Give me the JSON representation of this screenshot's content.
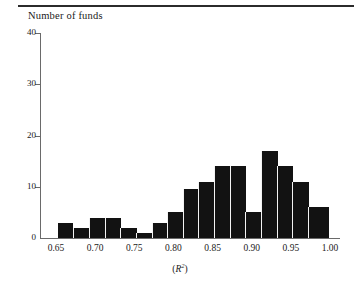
{
  "figure": {
    "top_rule": true,
    "title": "Number of funds",
    "x_axis_title_prefix": "(",
    "x_axis_title_var": "R",
    "x_axis_title_exp": "2",
    "x_axis_title_suffix": ")"
  },
  "chart_data": {
    "type": "bar",
    "title": "Number of funds",
    "xlabel": "(R^2)",
    "ylabel": "Number of funds",
    "xlim": [
      0.65,
      1.0
    ],
    "ylim": [
      0,
      40
    ],
    "grid": false,
    "legend": null,
    "bin_width": 0.02,
    "x_tick_labels": [
      "0.65",
      "0.70",
      "0.75",
      "0.80",
      "0.85",
      "0.90",
      "0.95",
      "1.00"
    ],
    "x_tick_values": [
      0.65,
      0.7,
      0.75,
      0.8,
      0.85,
      0.9,
      0.95,
      1.0
    ],
    "y_tick_labels": [
      "0",
      "10",
      "20",
      "30",
      "40"
    ],
    "y_tick_values": [
      0,
      10,
      20,
      30,
      40
    ],
    "bar_color": "#121212",
    "bins": [
      {
        "left": 0.652,
        "right": 0.672,
        "value": 3
      },
      {
        "left": 0.672,
        "right": 0.692,
        "value": 2
      },
      {
        "left": 0.692,
        "right": 0.712,
        "value": 4
      },
      {
        "left": 0.712,
        "right": 0.732,
        "value": 4
      },
      {
        "left": 0.732,
        "right": 0.752,
        "value": 2
      },
      {
        "left": 0.752,
        "right": 0.772,
        "value": 1
      },
      {
        "left": 0.772,
        "right": 0.792,
        "value": 3
      },
      {
        "left": 0.792,
        "right": 0.812,
        "value": 5
      },
      {
        "left": 0.812,
        "right": 0.832,
        "value": 9.5
      },
      {
        "left": 0.832,
        "right": 0.852,
        "value": 11
      },
      {
        "left": 0.852,
        "right": 0.872,
        "value": 14
      },
      {
        "left": 0.872,
        "right": 0.892,
        "value": 14
      },
      {
        "left": 0.892,
        "right": 0.912,
        "value": 5
      },
      {
        "left": 0.912,
        "right": 0.932,
        "value": 17
      },
      {
        "left": 0.932,
        "right": 0.952,
        "value": 14
      },
      {
        "left": 0.952,
        "right": 0.972,
        "value": 11
      },
      {
        "left": 0.972,
        "right": 0.998,
        "value": 6
      }
    ]
  }
}
